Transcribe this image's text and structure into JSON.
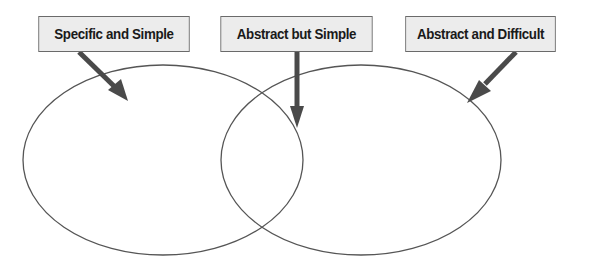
{
  "diagram": {
    "type": "venn",
    "labels": [
      {
        "id": "left",
        "text": "Specific and Simple",
        "points_to": "left-only region"
      },
      {
        "id": "center",
        "text": "Abstract but Simple",
        "points_to": "intersection region"
      },
      {
        "id": "right",
        "text": "Abstract and Difficult",
        "points_to": "right-only region"
      }
    ],
    "sets": 2,
    "colors": {
      "box_fill": "#ececec",
      "box_border": "#6a6a6a",
      "ellipse_stroke": "#555555",
      "arrow": "#4a4a4a",
      "background": "#ffffff"
    }
  }
}
